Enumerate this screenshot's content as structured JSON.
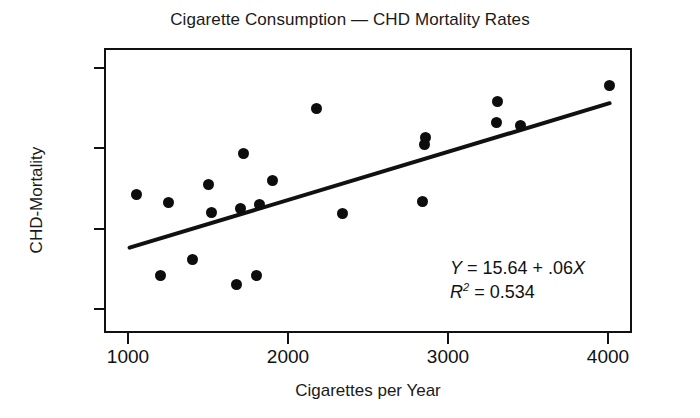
{
  "chart_data": {
    "type": "scatter",
    "title": "Cigarette Consumption — CHD Mortality Rates",
    "xlabel": "Cigarettes per Year",
    "ylabel": "CHD-Mortality",
    "xlim": [
      850,
      4150
    ],
    "ylim": [
      -30,
      325
    ],
    "xticks": [
      1000,
      2000,
      3000,
      4000
    ],
    "xtick_labels": [
      "1000",
      "2000",
      "3000",
      "4000"
    ],
    "yticks": [
      0,
      100,
      200,
      300
    ],
    "ytick_labels": [
      "0",
      "100",
      "200",
      "300"
    ],
    "grid": false,
    "legend": false,
    "marker_color": "#0d0d0d",
    "line_color": "#111111",
    "points": [
      {
        "x": 1050,
        "y": 143
      },
      {
        "x": 1200,
        "y": 42
      },
      {
        "x": 1250,
        "y": 133
      },
      {
        "x": 1400,
        "y": 62
      },
      {
        "x": 1500,
        "y": 155
      },
      {
        "x": 1520,
        "y": 120
      },
      {
        "x": 1680,
        "y": 30
      },
      {
        "x": 1700,
        "y": 125
      },
      {
        "x": 1720,
        "y": 194
      },
      {
        "x": 1800,
        "y": 42
      },
      {
        "x": 1820,
        "y": 130
      },
      {
        "x": 1900,
        "y": 160
      },
      {
        "x": 2180,
        "y": 250
      },
      {
        "x": 2340,
        "y": 119
      },
      {
        "x": 2850,
        "y": 205
      },
      {
        "x": 2860,
        "y": 213
      },
      {
        "x": 2840,
        "y": 134
      },
      {
        "x": 3300,
        "y": 232
      },
      {
        "x": 3310,
        "y": 258
      },
      {
        "x": 3450,
        "y": 228
      },
      {
        "x": 4010,
        "y": 278
      }
    ],
    "regression": {
      "equation_label": "Y = 15.64 + .06X",
      "intercept": 15.64,
      "slope": 0.06,
      "r_squared_label": "R2 = 0.534",
      "r_squared": 0.534,
      "x_start": 1010,
      "x_end": 4010
    },
    "annotation": {
      "line1_y": "Y",
      "line1_rest": " = 15.64 + .06",
      "line1_x": "X",
      "line2_r": "R",
      "line2_sup": "2",
      "line2_rest": " = 0.534"
    }
  }
}
